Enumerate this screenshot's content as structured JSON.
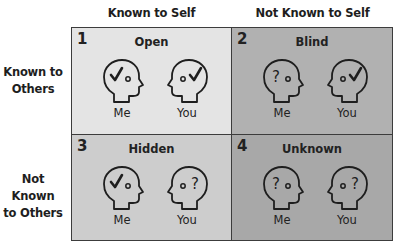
{
  "columns": [
    "Known to Self",
    "Not Known to Self"
  ],
  "rows": [
    {
      "line1": "Known to",
      "line2": "Others"
    },
    {
      "line1": "Not Known",
      "line2": "to Others"
    }
  ],
  "colors": {
    "open": "#e4e4e4",
    "blind": "#b1b1b1",
    "hidden": "#cdcdcd",
    "unknown": "#a8a8a8",
    "border": "#3c3c3c"
  },
  "quadrants": [
    {
      "number": "1",
      "title": "Open",
      "me": {
        "label": "Me",
        "symbol": "check-icon"
      },
      "you": {
        "label": "You",
        "symbol": "check-icon"
      }
    },
    {
      "number": "2",
      "title": "Blind",
      "me": {
        "label": "Me",
        "symbol": "question-icon"
      },
      "you": {
        "label": "You",
        "symbol": "check-icon"
      }
    },
    {
      "number": "3",
      "title": "Hidden",
      "me": {
        "label": "Me",
        "symbol": "check-icon"
      },
      "you": {
        "label": "You",
        "symbol": "question-icon"
      }
    },
    {
      "number": "4",
      "title": "Unknown",
      "me": {
        "label": "Me",
        "symbol": "question-icon"
      },
      "you": {
        "label": "You",
        "symbol": "question-icon"
      }
    }
  ]
}
